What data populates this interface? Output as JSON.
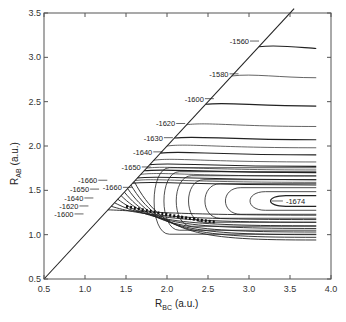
{
  "chart_data": {
    "type": "contour",
    "title": "",
    "xlabel": "R_BC (a.u.)",
    "xlabel_main": "R",
    "xlabel_sub": "BC",
    "xlabel_unit": "(a.u.)",
    "ylabel": "R_AB (a.u.)",
    "ylabel_main": "R",
    "ylabel_sub": "AB",
    "ylabel_unit": "(a.u.)",
    "xlim": [
      0.5,
      4.0
    ],
    "ylim": [
      0.5,
      3.5
    ],
    "xticks": [
      "0.5",
      "1.0",
      "1.5",
      "2.0",
      "2.5",
      "3.0",
      "3.5",
      "4.0"
    ],
    "yticks": [
      "0.5",
      "1.0",
      "1.5",
      "2.0",
      "2.5",
      "3.0",
      "3.5"
    ],
    "grid": false,
    "diagonal_line": {
      "from": [
        0.5,
        0.5
      ],
      "to": [
        3.55,
        3.55
      ],
      "meaning": "R_AB = R_BC boundary"
    },
    "upper_contour_levels": [
      -1560,
      -1580,
      -1600,
      -1620,
      -1630,
      -1640,
      -1650,
      -1660
    ],
    "lower_contour_levels": [
      -1660,
      -1650,
      -1640,
      -1620,
      -1600
    ],
    "minimum_label": {
      "value": -1674,
      "x": 3.45,
      "y": 1.38
    },
    "labels": [
      {
        "text": "-1560",
        "x": 3.0,
        "y": 3.15
      },
      {
        "text": "-1580",
        "x": 2.75,
        "y": 2.78
      },
      {
        "text": "-1600",
        "x": 2.45,
        "y": 2.5
      },
      {
        "text": "-1620",
        "x": 2.1,
        "y": 2.22
      },
      {
        "text": "-1630",
        "x": 1.95,
        "y": 2.06
      },
      {
        "text": "-1640",
        "x": 1.82,
        "y": 1.9
      },
      {
        "text": "-1650",
        "x": 1.68,
        "y": 1.73
      },
      {
        "text": "-1660",
        "x": 1.45,
        "y": 1.5
      },
      {
        "text": "-1660",
        "x": 1.15,
        "y": 1.58
      },
      {
        "text": "-1650",
        "x": 1.05,
        "y": 1.48
      },
      {
        "text": "-1640",
        "x": 0.98,
        "y": 1.38
      },
      {
        "text": "-1620",
        "x": 0.92,
        "y": 1.29
      },
      {
        "text": "-1600",
        "x": 0.86,
        "y": 1.2
      },
      {
        "text": "-1674",
        "x": 3.45,
        "y": 1.38
      }
    ],
    "entrance_channel_asymptotes_y": [
      3.1,
      2.77,
      2.45,
      2.22,
      2.07,
      1.98,
      1.9,
      1.82,
      1.77,
      1.73,
      1.7,
      1.66,
      1.62,
      1.59,
      1.56
    ],
    "well_ellipses_inner_x": [
      3.2,
      2.95,
      2.65,
      2.4,
      2.2,
      2.05,
      1.9,
      1.78
    ],
    "exit_channel_asymptotes_y": [
      1.22,
      1.17,
      1.14,
      1.1,
      1.07,
      1.03,
      1.0,
      0.97,
      0.94
    ]
  }
}
